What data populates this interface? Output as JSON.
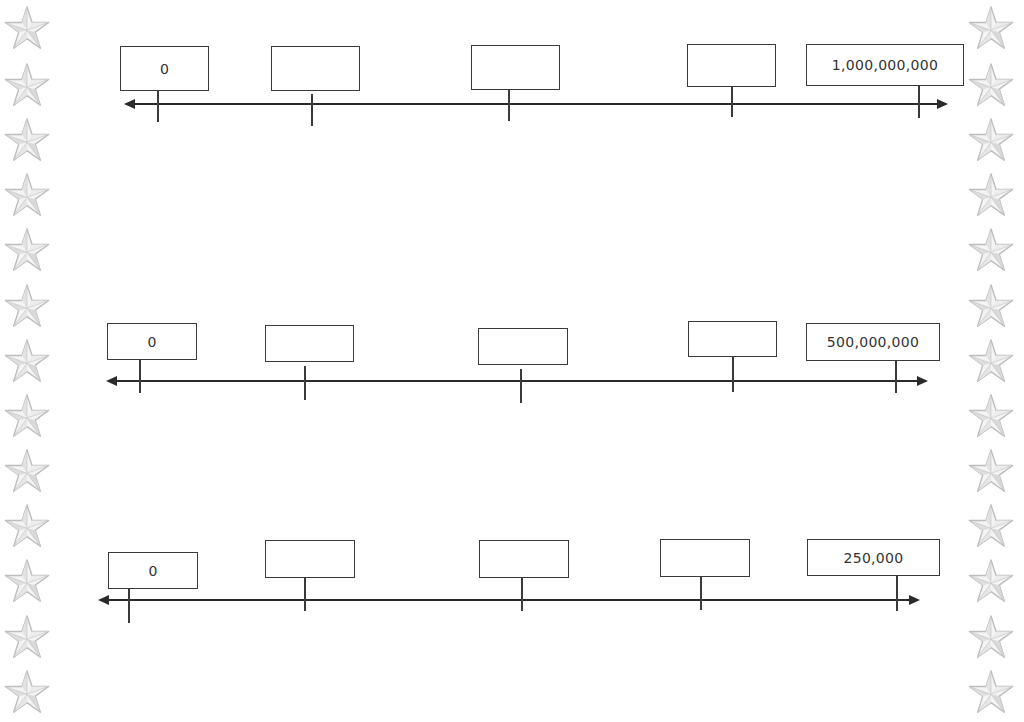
{
  "worksheet": {
    "border_icon": "star-icon",
    "star_color": "#bdbdbd",
    "line_color": "#2b2b2b",
    "number_lines": [
      {
        "name": "number-line-1",
        "y_line": 104,
        "x_start": 124,
        "x_end": 948,
        "boxes": [
          {
            "x": 120,
            "y": 46,
            "w": 89,
            "h": 45,
            "label": "0",
            "tick_x": 157,
            "tick_top": 91,
            "tick_bottom": 122
          },
          {
            "x": 271,
            "y": 46,
            "w": 89,
            "h": 45,
            "label": "",
            "tick_x": 311,
            "tick_top": 94,
            "tick_bottom": 126
          },
          {
            "x": 471,
            "y": 45,
            "w": 89,
            "h": 45,
            "label": "",
            "tick_x": 508,
            "tick_top": 90,
            "tick_bottom": 121
          },
          {
            "x": 687,
            "y": 44,
            "w": 89,
            "h": 43,
            "label": "",
            "tick_x": 731,
            "tick_top": 87,
            "tick_bottom": 117
          },
          {
            "x": 806,
            "y": 44,
            "w": 158,
            "h": 42,
            "label": "1,000,000,000",
            "tick_x": 918,
            "tick_top": 86,
            "tick_bottom": 118
          }
        ]
      },
      {
        "name": "number-line-2",
        "y_line": 381,
        "x_start": 106,
        "x_end": 928,
        "boxes": [
          {
            "x": 107,
            "y": 323,
            "w": 90,
            "h": 37,
            "label": "0",
            "tick_x": 139,
            "tick_top": 360,
            "tick_bottom": 393
          },
          {
            "x": 265,
            "y": 325,
            "w": 89,
            "h": 37,
            "label": "",
            "tick_x": 304,
            "tick_top": 366,
            "tick_bottom": 400
          },
          {
            "x": 478,
            "y": 328,
            "w": 90,
            "h": 37,
            "label": "",
            "tick_x": 520,
            "tick_top": 369,
            "tick_bottom": 403
          },
          {
            "x": 688,
            "y": 321,
            "w": 89,
            "h": 36,
            "label": "",
            "tick_x": 732,
            "tick_top": 357,
            "tick_bottom": 392
          },
          {
            "x": 806,
            "y": 323,
            "w": 134,
            "h": 38,
            "label": "500,000,000",
            "tick_x": 895,
            "tick_top": 361,
            "tick_bottom": 393
          }
        ]
      },
      {
        "name": "number-line-3",
        "y_line": 600,
        "x_start": 98,
        "x_end": 920,
        "boxes": [
          {
            "x": 108,
            "y": 552,
            "w": 90,
            "h": 37,
            "label": "0",
            "tick_x": 128,
            "tick_top": 589,
            "tick_bottom": 623
          },
          {
            "x": 265,
            "y": 540,
            "w": 90,
            "h": 38,
            "label": "",
            "tick_x": 304,
            "tick_top": 578,
            "tick_bottom": 611
          },
          {
            "x": 479,
            "y": 540,
            "w": 90,
            "h": 38,
            "label": "",
            "tick_x": 521,
            "tick_top": 578,
            "tick_bottom": 611
          },
          {
            "x": 660,
            "y": 539,
            "w": 90,
            "h": 38,
            "label": "",
            "tick_x": 700,
            "tick_top": 577,
            "tick_bottom": 610
          },
          {
            "x": 807,
            "y": 539,
            "w": 133,
            "h": 37,
            "label": "250,000",
            "tick_x": 896,
            "tick_top": 576,
            "tick_bottom": 611
          }
        ]
      }
    ]
  }
}
